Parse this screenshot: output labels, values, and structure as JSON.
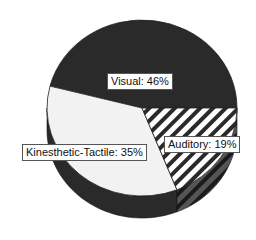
{
  "chart_data": {
    "type": "pie",
    "title": "",
    "style": "3d",
    "slices": [
      {
        "name": "Visual",
        "value": 46,
        "label": "Visual: 46%",
        "fill": "#2a2a2a",
        "pattern": "solid-dark"
      },
      {
        "name": "Kinesthetic-Tactile",
        "value": 35,
        "label": "Kinesthetic-Tactile: 35%",
        "fill": "#f2f2f2",
        "pattern": "solid-light"
      },
      {
        "name": "Auditory",
        "value": 19,
        "label": "Auditory: 19%",
        "fill": "#ffffff",
        "pattern": "diagonal-stripes"
      }
    ],
    "start_direction": "right (3 o'clock)",
    "direction": "counterclockwise",
    "legend": "none"
  }
}
